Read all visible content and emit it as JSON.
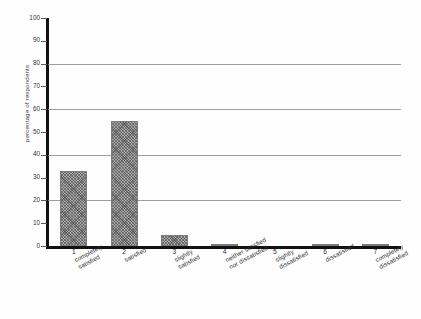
{
  "chart_data": {
    "type": "bar",
    "title": "",
    "xlabel": "",
    "ylabel": "percentage of respondents",
    "ylim": [
      0,
      100
    ],
    "ytick_values": [
      0,
      10,
      20,
      30,
      40,
      50,
      60,
      70,
      80,
      90,
      100
    ],
    "ytick_labels": [
      "0",
      "10",
      "20",
      "30",
      "40",
      "50",
      "60",
      "70",
      "80",
      "90",
      "100"
    ],
    "gridline_values": [
      20,
      40,
      60,
      80
    ],
    "grid": true,
    "legend": "none",
    "categories": [
      "completely satisfied",
      "satisfied",
      "slightly satisfied",
      "neither satisfied nor dissatisfied",
      "slightly dissatisfied",
      "dissatisfied",
      "completely dissatisfied"
    ],
    "category_numbers": [
      "1",
      "2",
      "3",
      "4",
      "5",
      "6",
      "7"
    ],
    "category_lines": [
      [
        "completely",
        "satisfied"
      ],
      [
        "satisfied"
      ],
      [
        "slightly",
        "satisfied"
      ],
      [
        "neither satisfied",
        "nor dissatisfied"
      ],
      [
        "slightly",
        "dissatisfied"
      ],
      [
        "dissatisfied"
      ],
      [
        "completely",
        "dissatisfied"
      ]
    ],
    "values": [
      33,
      55,
      5,
      1,
      0,
      1,
      1
    ],
    "bar_fill": "#a8a8a8",
    "axis_color": "#111111",
    "grid_color": "#8d8d8d"
  }
}
